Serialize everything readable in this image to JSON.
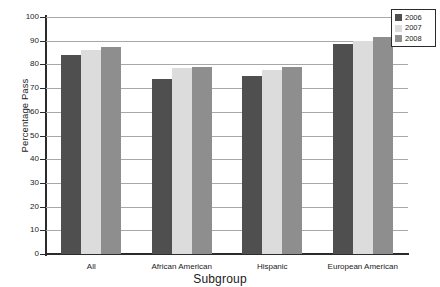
{
  "chart_data": {
    "type": "bar",
    "title": "",
    "xlabel": "Subgroup",
    "ylabel": "Percentage Pass",
    "categories": [
      "All",
      "African American",
      "Hispanic",
      "European American"
    ],
    "series": [
      {
        "name": "2006",
        "color": "#4f4f4f",
        "values": [
          84,
          74,
          75,
          88.5
        ]
      },
      {
        "name": "2007",
        "color": "#dcdcdc",
        "values": [
          86,
          78.5,
          77.5,
          90
        ]
      },
      {
        "name": "2008",
        "color": "#8e8e8e",
        "values": [
          87.5,
          79,
          79,
          91.5
        ]
      }
    ],
    "ylim": [
      0,
      100
    ],
    "yticks": [
      0,
      10,
      20,
      30,
      40,
      50,
      60,
      70,
      80,
      90,
      100
    ],
    "ytick_labels": [
      "0",
      "10",
      "20",
      "30",
      "40",
      "50",
      "60",
      "70",
      "80",
      "90",
      "100"
    ],
    "grid": true,
    "legend_position": "top-right",
    "legend_entries": [
      "2006",
      "2007",
      "2008"
    ]
  }
}
